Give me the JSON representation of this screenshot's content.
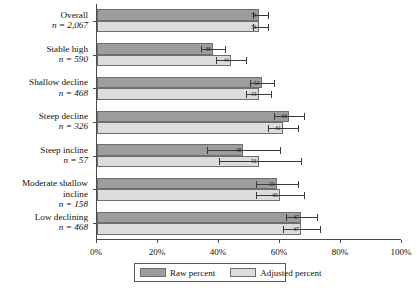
{
  "chart_data": {
    "type": "bar",
    "orientation": "horizontal",
    "title": "",
    "xlabel": "",
    "ylabel": "",
    "xlim": [
      0,
      100
    ],
    "xticks": [
      0,
      20,
      40,
      60,
      80,
      100
    ],
    "xticklabels": [
      "0%",
      "20%",
      "40%",
      "60%",
      "80%",
      "100%"
    ],
    "grid": false,
    "legend_position": "bottom",
    "categories": [
      "Overall",
      "Stable high",
      "Shallow decline",
      "Steep decline",
      "Steep incline",
      "Moderate shallow incline",
      "Low declining"
    ],
    "category_counts": [
      "n = 2,067",
      "n = 590",
      "n = 468",
      "n = 326",
      "n = 57",
      "n = 158",
      "n = 468"
    ],
    "series": [
      {
        "name": "Raw percent",
        "color": "#9d9d9d",
        "values": [
          53,
          38,
          54,
          63,
          48,
          59,
          67
        ],
        "labels": [
          "53",
          "38",
          "54",
          "63",
          "48",
          "59",
          "67"
        ],
        "err_low": [
          51,
          34,
          50,
          58,
          36,
          52,
          62
        ],
        "err_high": [
          56,
          42,
          58,
          68,
          60,
          66,
          72
        ]
      },
      {
        "name": "Adjusted percent",
        "color": "#dcdcdc",
        "values": [
          53,
          44,
          53,
          61,
          53,
          60,
          67
        ],
        "labels": [
          "53",
          "44",
          "53",
          "61",
          "53",
          "60",
          "67"
        ],
        "err_low": [
          51,
          39,
          49,
          56,
          40,
          52,
          61
        ],
        "err_high": [
          56,
          49,
          57,
          66,
          67,
          68,
          73
        ]
      }
    ]
  },
  "legend": {
    "items": [
      {
        "label": "Raw percent"
      },
      {
        "label": "Adjusted percent"
      }
    ]
  }
}
